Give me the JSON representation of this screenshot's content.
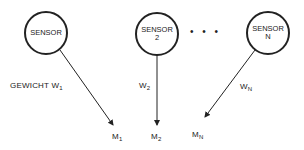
{
  "sensors": [
    {
      "label": "SENSOR",
      "sub": ""
    },
    {
      "label": "SENSOR",
      "sub": "2"
    },
    {
      "label": "SENSOR",
      "sub": "N"
    }
  ],
  "ellipsis": "• • •",
  "weights": [
    {
      "prefix": "GEWICHT W",
      "index": "1"
    },
    {
      "prefix": "W",
      "index": "2"
    },
    {
      "prefix": "W",
      "index": "N"
    }
  ],
  "outputs": [
    {
      "label": "M",
      "index": "1"
    },
    {
      "label": "M",
      "index": "2"
    },
    {
      "label": "M",
      "index": "N"
    }
  ]
}
